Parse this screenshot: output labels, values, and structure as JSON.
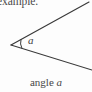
{
  "figure": {
    "type": "geometry-angle-diagram",
    "background_color": "#fdfdfd",
    "ink_color": "#3a3a3a",
    "header_text": "example.",
    "caption": {
      "word": "angle",
      "variable": "a"
    },
    "angle_label": "a",
    "geometry": {
      "vertex": {
        "x": 11,
        "y": 45
      },
      "upper_ray_end": {
        "x": 89,
        "y": 2
      },
      "lower_ray_end": {
        "x": 92,
        "y": 70
      },
      "arc_radius": 11,
      "stroke_width": 1.1
    }
  }
}
